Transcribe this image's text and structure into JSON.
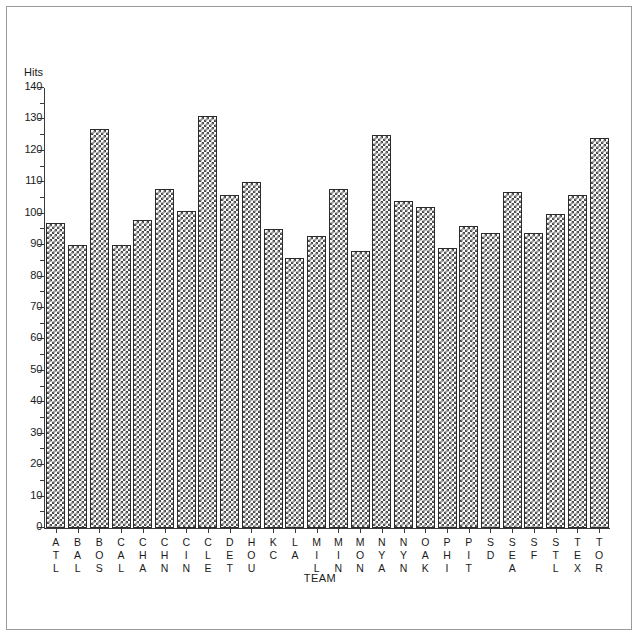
{
  "figure": {
    "background_color": "#ffffff",
    "frame_color": "#9a9a9a",
    "axis_color": "#3a3a3a",
    "bar_fill_color": "#4a4a4a",
    "bar_edge_color": "#2b2b2b"
  },
  "chart_data": {
    "type": "bar",
    "title": "",
    "subtitle": "",
    "xlabel": "TEAM",
    "ylabel": "Hits",
    "ylim": [
      0,
      140
    ],
    "ytick_step": 10,
    "yticks": [
      0,
      10,
      20,
      30,
      40,
      50,
      60,
      70,
      80,
      90,
      100,
      110,
      120,
      130,
      140
    ],
    "ytick_labels": [
      "0",
      "10",
      "20",
      "30",
      "40",
      "50",
      "60",
      "70",
      "80",
      "90",
      "100",
      "110",
      "120",
      "130",
      "140"
    ],
    "grid": false,
    "legend": null,
    "legend_position": "none",
    "categories": [
      "ATL",
      "BAL",
      "BOS",
      "CAL",
      "CHA",
      "CHN",
      "CIN",
      "CLE",
      "DET",
      "HOU",
      "KC",
      "LA",
      "MIL",
      "MIN",
      "MON",
      "NYA",
      "NYN",
      "OAK",
      "PHI",
      "PIT",
      "SD",
      "SEA",
      "SF",
      "STL",
      "TEX",
      "TOR"
    ],
    "values": [
      97,
      90,
      127,
      90,
      98,
      108,
      101,
      131,
      106,
      110,
      95,
      86,
      93,
      108,
      88,
      125,
      104,
      102,
      89,
      96,
      94,
      107,
      94,
      100,
      106,
      124
    ]
  }
}
